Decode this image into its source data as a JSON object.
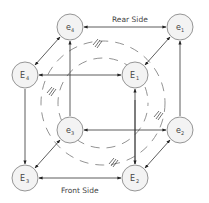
{
  "diagram": {
    "labels": {
      "rear_side": "Rear Side",
      "front_side": "Front Side"
    },
    "nodes": [
      {
        "id": "e4",
        "base": "e",
        "sub": "4",
        "x": 70,
        "y": 27
      },
      {
        "id": "e1",
        "base": "e",
        "sub": "1",
        "x": 180,
        "y": 27
      },
      {
        "id": "E4",
        "base": "E",
        "sub": "4",
        "x": 25,
        "y": 75
      },
      {
        "id": "E1",
        "base": "E",
        "sub": "1",
        "x": 135,
        "y": 75
      },
      {
        "id": "e3",
        "base": "e",
        "sub": "3",
        "x": 70,
        "y": 130
      },
      {
        "id": "e2",
        "base": "e",
        "sub": "2",
        "x": 180,
        "y": 130
      },
      {
        "id": "E3",
        "base": "E",
        "sub": "3",
        "x": 25,
        "y": 178
      },
      {
        "id": "E2",
        "base": "E",
        "sub": "2",
        "x": 135,
        "y": 178
      }
    ],
    "edges": [
      {
        "from": "e4",
        "to": "e1",
        "type": "bidirectional"
      },
      {
        "from": "E4",
        "to": "E1",
        "type": "bidirectional"
      },
      {
        "from": "e3",
        "to": "e2",
        "type": "bidirectional"
      },
      {
        "from": "E3",
        "to": "E2",
        "type": "bidirectional"
      },
      {
        "from": "e4",
        "to": "E4",
        "type": "bidirectional"
      },
      {
        "from": "e1",
        "to": "E1",
        "type": "bidirectional"
      },
      {
        "from": "e3",
        "to": "E3",
        "type": "bidirectional"
      },
      {
        "from": "e2",
        "to": "E2",
        "type": "bidirectional"
      },
      {
        "from": "E4",
        "to": "E3",
        "type": "directed"
      },
      {
        "from": "e4",
        "to": "e3",
        "type": "directed"
      },
      {
        "from": "E2",
        "to": "E1",
        "type": "directed"
      },
      {
        "from": "e2",
        "to": "e1",
        "type": "directed"
      }
    ],
    "colors": {
      "node_fill": "#f3f3f3",
      "node_stroke": "#8a8a8a",
      "edge": "#333333",
      "dashed_arc": "#777777"
    }
  }
}
